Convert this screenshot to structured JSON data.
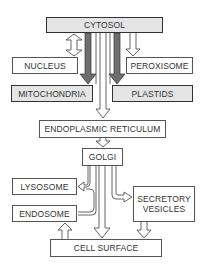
{
  "diagram": {
    "nodes": {
      "cytosol": "CYTOSOL",
      "nucleus": "NUCLEUS",
      "peroxisome": "PEROXISOME",
      "mitochondria": "MITOCHONDRIA",
      "plastids": "PLASTIDS",
      "er": "ENDOPLASMIC RETICULUM",
      "golgi": "GOLGI",
      "lysosome": "LYSOSOME",
      "endosome": "ENDOSOME",
      "secretory_vesicles": "SECRETORY VESICLES",
      "cell_surface": "CELL SURFACE"
    },
    "edges": [
      {
        "from": "CYTOSOL",
        "to": "NUCLEUS",
        "style": "double-headed hollow"
      },
      {
        "from": "CYTOSOL",
        "to": "MITOCHONDRIA",
        "style": "solid gray"
      },
      {
        "from": "CYTOSOL",
        "to": "PLASTIDS",
        "style": "solid gray"
      },
      {
        "from": "CYTOSOL",
        "to": "PEROXISOME",
        "style": "hollow"
      },
      {
        "from": "CYTOSOL",
        "to": "ENDOPLASMIC RETICULUM",
        "style": "hollow"
      },
      {
        "from": "ENDOPLASMIC RETICULUM",
        "to": "GOLGI",
        "style": "hollow"
      },
      {
        "from": "GOLGI",
        "to": "LYSOSOME",
        "style": "hollow"
      },
      {
        "from": "ENDOSOME",
        "to": "LYSOSOME",
        "style": "hollow"
      },
      {
        "from": "GOLGI",
        "to": "SECRETORY VESICLES",
        "style": "hollow"
      },
      {
        "from": "GOLGI",
        "to": "CELL SURFACE",
        "style": "hollow"
      },
      {
        "from": "SECRETORY VESICLES",
        "to": "CELL SURFACE",
        "style": "hollow"
      },
      {
        "from": "CELL SURFACE",
        "to": "ENDOSOME",
        "style": "hollow"
      }
    ],
    "colors": {
      "gray_box_fill": "#e4e4e4",
      "gray_arrow_fill": "#6e6e6e",
      "border": "#444444"
    }
  }
}
